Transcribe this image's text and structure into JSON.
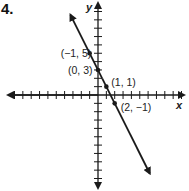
{
  "problem": {
    "number": "4."
  },
  "chart_data": {
    "type": "line",
    "title": "",
    "xlabel": "x",
    "ylabel": "y",
    "xlim": [
      -10,
      10
    ],
    "ylim": [
      -11,
      11
    ],
    "grid": false,
    "tick_interval": 1,
    "equation": "y = -2x + 3",
    "series": [
      {
        "name": "line",
        "slope": -2,
        "intercept": 3,
        "arrows_both_ends": true,
        "points": [
          {
            "x": -1,
            "y": 5,
            "label": "(−1, 5)"
          },
          {
            "x": 0,
            "y": 3,
            "label": "(0, 3)"
          },
          {
            "x": 1,
            "y": 1,
            "label": "(1, 1)"
          },
          {
            "x": 2,
            "y": -1,
            "label": "(2, −1)"
          }
        ]
      }
    ]
  },
  "colors": {
    "ink": "#1a1a1a"
  }
}
